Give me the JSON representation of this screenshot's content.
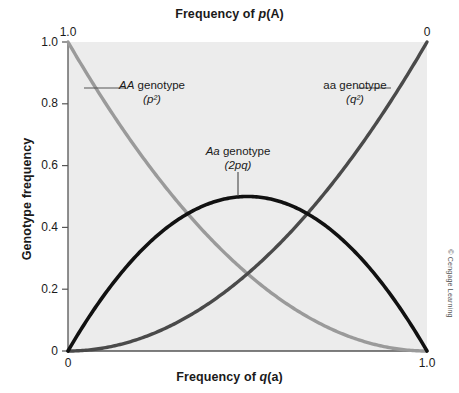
{
  "chart_data": {
    "type": "line",
    "title": "Frequency of p(A)",
    "xlabel": "Frequency of q(a)",
    "ylabel": "Genotype frequency",
    "top_axis_label": "Frequency of p(A)",
    "xlim": [
      0,
      1
    ],
    "ylim": [
      0,
      1
    ],
    "grid": false,
    "legend_position": "inline-annotations",
    "x_ticks": [
      "0",
      "1.0"
    ],
    "x_tick_values": [
      0,
      1
    ],
    "y_ticks": [
      "0",
      "0.2",
      "0.4",
      "0.6",
      "0.8",
      "1.0"
    ],
    "y_tick_values": [
      0,
      0.2,
      0.4,
      0.6,
      0.8,
      1.0
    ],
    "top_ticks": [
      "1.0",
      "0"
    ],
    "top_tick_values": [
      1.0,
      0
    ],
    "x": [
      0,
      0.05,
      0.1,
      0.15,
      0.2,
      0.25,
      0.3,
      0.35,
      0.4,
      0.45,
      0.5,
      0.55,
      0.6,
      0.65,
      0.7,
      0.75,
      0.8,
      0.85,
      0.9,
      0.95,
      1.0
    ],
    "series": [
      {
        "name": "AA genotype (p²)",
        "color": "#9a9a9a",
        "formula": "p^2 = (1-q)^2",
        "values": [
          1.0,
          0.9025,
          0.81,
          0.7225,
          0.64,
          0.5625,
          0.49,
          0.4225,
          0.36,
          0.3025,
          0.25,
          0.2025,
          0.16,
          0.1225,
          0.09,
          0.0625,
          0.04,
          0.0225,
          0.01,
          0.0025,
          0.0
        ]
      },
      {
        "name": "Aa genotype (2pq)",
        "color": "#111111",
        "formula": "2pq = 2q(1-q)",
        "values": [
          0.0,
          0.095,
          0.18,
          0.255,
          0.32,
          0.375,
          0.42,
          0.455,
          0.48,
          0.495,
          0.5,
          0.495,
          0.48,
          0.455,
          0.42,
          0.375,
          0.32,
          0.255,
          0.18,
          0.095,
          0.0
        ]
      },
      {
        "name": "aa genotype (q²)",
        "color": "#4a4a4a",
        "formula": "q^2",
        "values": [
          0.0,
          0.0025,
          0.01,
          0.0225,
          0.04,
          0.0625,
          0.09,
          0.1225,
          0.16,
          0.2025,
          0.25,
          0.3025,
          0.36,
          0.4225,
          0.49,
          0.5625,
          0.64,
          0.7225,
          0.81,
          0.9025,
          1.0
        ]
      }
    ],
    "annotations": [
      {
        "id": "aa-dominant",
        "text": "AA genotype",
        "sub": "(p²)",
        "italic_prefix": "AA",
        "symbol": "(p²)"
      },
      {
        "id": "heterozygote",
        "text": "Aa genotype",
        "sub": "(2pq)",
        "italic_prefix": "Aa",
        "symbol": "(2pq)"
      },
      {
        "id": "aa-recessive",
        "text": "aa genotype",
        "sub": "(q²)",
        "italic_prefix": "aa",
        "symbol": "(q²)"
      }
    ],
    "credit": "© Cengage Learning",
    "plot_background": "#ececec",
    "figure_background": "#ffffff"
  },
  "labels": {
    "title": "Frequency of p(A)",
    "title_plain": "Frequency of ",
    "title_italic": "p",
    "title_tail": "(A)",
    "xaxis_plain": "Frequency of ",
    "xaxis_italic": "q",
    "xaxis_tail": "(a)",
    "yaxis": "Genotype frequency",
    "y_tick_0": "0",
    "y_tick_02": "0.2",
    "y_tick_04": "0.4",
    "y_tick_06": "0.6",
    "y_tick_08": "0.8",
    "y_tick_10": "1.0",
    "x_tick_left": "0",
    "x_tick_right": "1.0",
    "top_tick_left": "1.0",
    "top_tick_right": "0",
    "annot_dom_name": "AA",
    "annot_dom_word": " genotype",
    "annot_dom_sym": "(p²)",
    "annot_het_name": "Aa",
    "annot_het_word": " genotype",
    "annot_het_sym": "(2pq)",
    "annot_rec_name": "aa",
    "annot_rec_word": " genotype",
    "annot_rec_sym": "(q²)",
    "credit": "© Cengage Learning"
  }
}
